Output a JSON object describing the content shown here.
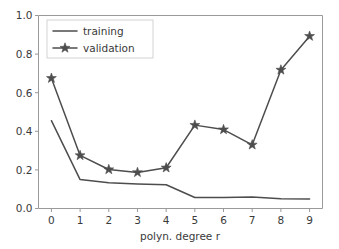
{
  "chart_data": {
    "type": "line",
    "title": "",
    "xlabel": "polyn. degree r",
    "ylabel": "",
    "x": [
      0,
      1,
      2,
      3,
      4,
      5,
      6,
      7,
      8,
      9
    ],
    "xticklabels": [
      "0",
      "1",
      "2",
      "3",
      "4",
      "5",
      "6",
      "7",
      "8",
      "9"
    ],
    "yticklabels": [
      "0.0",
      "0.2",
      "0.4",
      "0.6",
      "0.8",
      "1.0"
    ],
    "yticks": [
      0.0,
      0.2,
      0.4,
      0.6,
      0.8,
      1.0
    ],
    "xlim": [
      -0.45,
      9.45
    ],
    "ylim": [
      0.0,
      1.0
    ],
    "grid": false,
    "legend_position": "upper left",
    "series": [
      {
        "name": "training",
        "marker": "none",
        "color": "#4d4d4d",
        "values": [
          0.455,
          0.15,
          0.133,
          0.127,
          0.123,
          0.057,
          0.057,
          0.059,
          0.05,
          0.049
        ]
      },
      {
        "name": "validation",
        "marker": "star",
        "color": "#4d4d4d",
        "values": [
          0.675,
          0.275,
          0.202,
          0.187,
          0.211,
          0.432,
          0.409,
          0.33,
          0.718,
          0.893
        ]
      }
    ]
  },
  "legend": {
    "entries": [
      {
        "label": "training"
      },
      {
        "label": "validation"
      }
    ]
  }
}
